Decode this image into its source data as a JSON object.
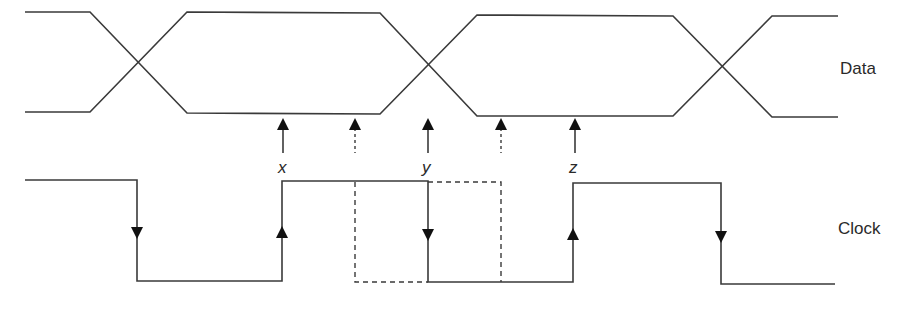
{
  "diagram": {
    "title": "",
    "signals": [
      {
        "name": "Data",
        "label": "Data",
        "type": "bus-eye"
      },
      {
        "name": "Clock",
        "label": "Clock",
        "type": "square-wave"
      }
    ],
    "sample_points": [
      {
        "label": "x",
        "style": "solid"
      },
      {
        "label": "",
        "style": "dashed"
      },
      {
        "label": "y",
        "style": "solid"
      },
      {
        "label": "",
        "style": "dashed"
      },
      {
        "label": "z",
        "style": "solid"
      }
    ],
    "clock_edges": [
      "falling",
      "rising",
      "falling",
      "rising",
      "falling"
    ],
    "dashed_alternative_clock": "shifted half-phase between dashed sample points",
    "colors": {
      "stroke": "#3a3a3a",
      "arrow": "#111111",
      "background": "#ffffff"
    }
  },
  "labels": {
    "data": "Data",
    "clock": "Clock",
    "x": "x",
    "y": "y",
    "z": "z"
  }
}
